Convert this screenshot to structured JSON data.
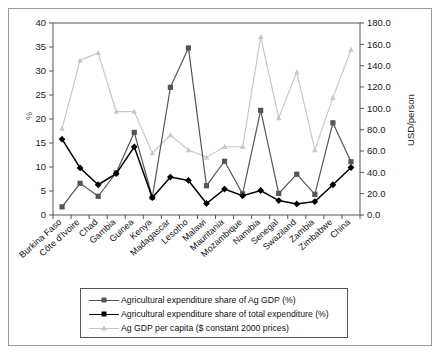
{
  "chart_data": {
    "type": "line",
    "title": "",
    "xlabel": "",
    "ylabel": "%",
    "ylabel_right": "USD/person",
    "grid": false,
    "legend_position": "bottom",
    "ylim": [
      0,
      40
    ],
    "ylim_right": [
      0,
      180
    ],
    "yticks": [
      "0",
      "5",
      "10",
      "15",
      "20",
      "25",
      "30",
      "35",
      "40"
    ],
    "yticks_right": [
      "0.0",
      "20.0",
      "40.0",
      "60.0",
      "80.0",
      "100.0",
      "120.0",
      "140.0",
      "160.0",
      "180.0"
    ],
    "categories": [
      "Burkina Faso",
      "Côte d'Ivoire",
      "Chad",
      "Gambia",
      "Guinea",
      "Kenya",
      "Madagascar",
      "Lesotho",
      "Malawi",
      "Mauritania",
      "Mozambique",
      "Namibia",
      "Senegal",
      "Swaziland",
      "Zambia",
      "Zimbabwe",
      "China"
    ],
    "series": [
      {
        "name": "Agricultural expenditure share of Ag GDP (%)",
        "axis": "left",
        "color": "#555555",
        "marker": "square",
        "values": [
          1.7,
          6.6,
          3.9,
          8.8,
          17.2,
          3.7,
          26.6,
          34.8,
          6.1,
          11.2,
          4.4,
          21.8,
          4.5,
          8.5,
          4.3,
          19.2,
          11.1
        ]
      },
      {
        "name": "Agricultural expenditure share of total expenditure (%)",
        "axis": "left",
        "color": "#000000",
        "marker": "diamond",
        "values": [
          15.8,
          9.8,
          6.3,
          8.6,
          14.2,
          3.6,
          7.9,
          7.2,
          2.4,
          5.4,
          4.0,
          5.1,
          3.0,
          2.3,
          2.8,
          6.3,
          9.9
        ]
      },
      {
        "name": "Ag GDP per capita ($ constant 2000 prices)",
        "axis": "right",
        "color": "#c8c8c8",
        "marker": "triangle",
        "values": [
          81,
          145,
          152,
          97,
          97,
          58,
          75,
          61,
          54,
          64,
          64,
          167,
          91,
          134,
          61,
          110,
          155
        ]
      }
    ]
  },
  "legend": {
    "items": [
      {
        "label": "Agricultural expenditure share of Ag GDP (%)",
        "color": "#555555",
        "marker": "square"
      },
      {
        "label": "Agricultural expenditure share of total expenditure (%)",
        "color": "#000000",
        "marker": "diamond"
      },
      {
        "label": "Ag GDP per capita ($ constant 2000 prices)",
        "color": "#c8c8c8",
        "marker": "triangle"
      }
    ]
  }
}
